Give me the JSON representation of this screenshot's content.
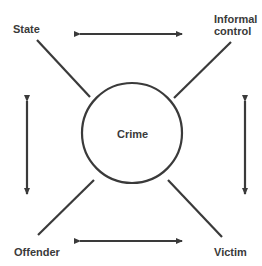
{
  "nodes": {
    "center": "Crime",
    "top_left": "State",
    "top_right_line1": "Informal",
    "top_right_line2": "control",
    "bottom_left": "Offender",
    "bottom_right": "Victim"
  },
  "colors": {
    "stroke": "#3a3a3a",
    "background": "#ffffff"
  }
}
